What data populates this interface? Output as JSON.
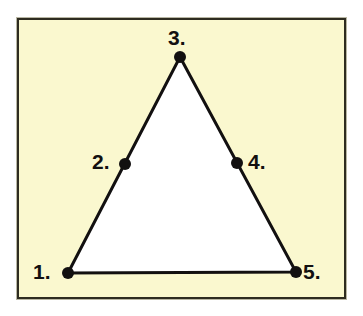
{
  "figure": {
    "background_color": "#ffffff",
    "panel_color": "#faf8cf",
    "frame_color": "#2e2c20",
    "shape_fill": "#ffffff",
    "stroke_color": "#121010",
    "dot_color": "#121010"
  },
  "shape": {
    "name": "triangle",
    "stroke_width": 3,
    "points": "68,273 180,57 296,272",
    "vertices": [
      {
        "x": 68,
        "y": 273
      },
      {
        "x": 180,
        "y": 57
      },
      {
        "x": 296,
        "y": 272
      }
    ]
  },
  "points": [
    {
      "id": "point-1",
      "label": "1.",
      "x": 68,
      "y": 273,
      "radius": 6,
      "label_position": "left",
      "role": "vertex"
    },
    {
      "id": "point-2",
      "label": "2.",
      "x": 125,
      "y": 164,
      "radius": 6,
      "label_position": "left",
      "role": "edge-midpoint"
    },
    {
      "id": "point-3",
      "label": "3.",
      "x": 180,
      "y": 57,
      "radius": 6,
      "label_position": "above",
      "role": "vertex"
    },
    {
      "id": "point-4",
      "label": "4.",
      "x": 237,
      "y": 163,
      "radius": 6,
      "label_position": "right",
      "role": "edge-midpoint"
    },
    {
      "id": "point-5",
      "label": "5.",
      "x": 296,
      "y": 272,
      "radius": 6,
      "label_position": "right",
      "role": "vertex"
    }
  ]
}
